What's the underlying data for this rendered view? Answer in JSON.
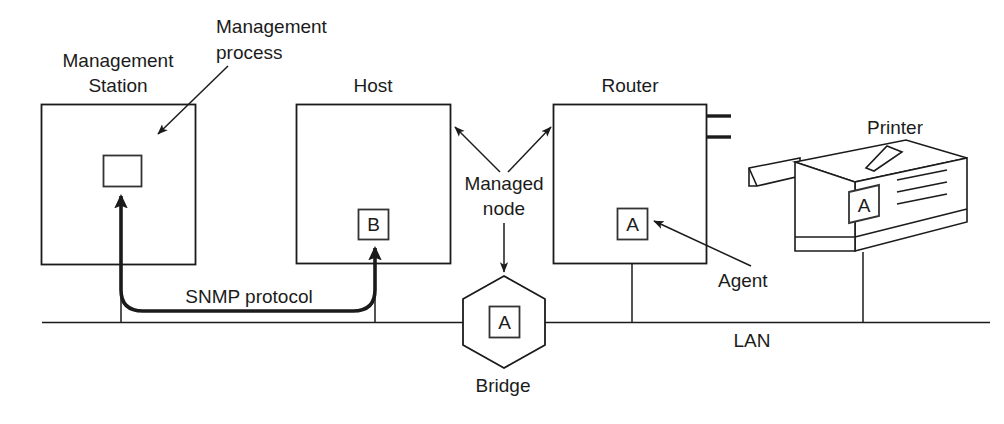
{
  "diagram": {
    "background_color": "#ffffff",
    "line_color": "#1b1b1b",
    "labels": {
      "management_station_line1": "Management",
      "management_station_line2": "Station",
      "management_process_line1": "Management",
      "management_process_line2": "process",
      "host": "Host",
      "router": "Router",
      "printer": "Printer",
      "managed_node_line1": "Managed",
      "managed_node_line2": "node",
      "agent": "Agent",
      "bridge": "Bridge",
      "lan": "LAN",
      "snmp_protocol": "SNMP protocol"
    },
    "nodes": [
      {
        "id": "management-station",
        "label": "Management Station",
        "shape": "rectangle",
        "inner_box_letter": "",
        "inner_box_role": "management process"
      },
      {
        "id": "host",
        "label": "Host",
        "shape": "rectangle",
        "inner_box_letter": "B",
        "inner_box_role": "agent"
      },
      {
        "id": "router",
        "label": "Router",
        "shape": "rectangle",
        "inner_box_letter": "A",
        "inner_box_role": "agent"
      },
      {
        "id": "bridge",
        "label": "Bridge",
        "shape": "hexagon",
        "inner_box_letter": "A",
        "inner_box_role": "agent"
      },
      {
        "id": "printer",
        "label": "Printer",
        "shape": "3d-box",
        "inner_box_letter": "A",
        "inner_box_role": "agent"
      }
    ],
    "connections": {
      "bus_label": "LAN",
      "protocol_label": "SNMP protocol",
      "attached_nodes": [
        "management-station",
        "host",
        "bridge",
        "router",
        "printer"
      ]
    },
    "annotations": [
      {
        "id": "management-process-callout",
        "text": "Management process",
        "points_to": "management-station inner box"
      },
      {
        "id": "managed-node-callout",
        "text": "Managed node",
        "points_to": "host, router, bridge"
      },
      {
        "id": "agent-callout",
        "text": "Agent",
        "points_to": "router inner box A"
      }
    ]
  }
}
